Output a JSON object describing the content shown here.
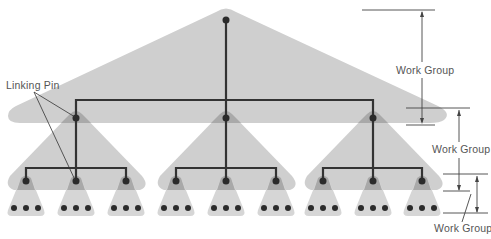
{
  "diagram": {
    "labels": {
      "linking_pin": "Linking Pin",
      "work_group_top": "Work Group",
      "work_group_middle": "Work Group",
      "work_group_bottom": "Work Group"
    },
    "colors": {
      "shape_fill": "#cfcfcf",
      "overlap_fill": "#a9a9a9",
      "line": "#333333",
      "node": "#2b2b2b",
      "dimension_line": "#444444",
      "text": "#555555"
    },
    "levels": [
      {
        "name": "top",
        "nodes": [
          {
            "x": 226,
            "y": 20
          }
        ]
      },
      {
        "name": "middle",
        "nodes": [
          {
            "x": 76,
            "y": 118
          },
          {
            "x": 226,
            "y": 118
          },
          {
            "x": 373,
            "y": 118
          }
        ]
      },
      {
        "name": "lower",
        "nodes": [
          {
            "x": 26,
            "y": 181
          },
          {
            "x": 76,
            "y": 181
          },
          {
            "x": 126,
            "y": 181
          },
          {
            "x": 176,
            "y": 181
          },
          {
            "x": 226,
            "y": 181
          },
          {
            "x": 276,
            "y": 181
          },
          {
            "x": 323,
            "y": 181
          },
          {
            "x": 373,
            "y": 181
          },
          {
            "x": 422,
            "y": 181
          }
        ]
      },
      {
        "name": "bottom",
        "groups": 9,
        "dots_per_group": 3
      }
    ]
  }
}
